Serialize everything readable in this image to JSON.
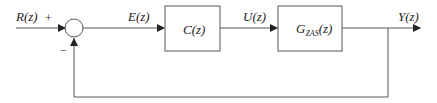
{
  "diagram": {
    "type": "feedback-control-block-diagram",
    "signals": {
      "input": "R(z)",
      "error": "E(z)",
      "control": "U(z)",
      "output": "Y(z)"
    },
    "summing_junction": {
      "plus_sign": "+",
      "minus_sign": "−"
    },
    "blocks": [
      {
        "id": "controller",
        "label": "C(z)"
      },
      {
        "id": "plant",
        "label_main": "G",
        "label_sub": "ZAS",
        "label_arg": "(z)"
      }
    ],
    "colors": {
      "line": "#444444",
      "background": "#ffffff"
    }
  }
}
